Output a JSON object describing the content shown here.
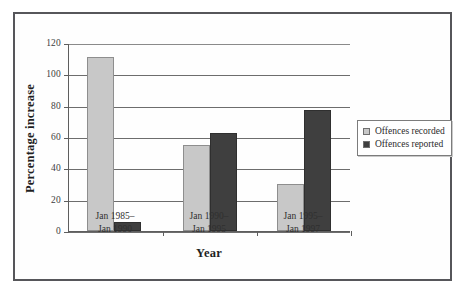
{
  "chart_data": {
    "type": "bar",
    "title": "",
    "xlabel": "Year",
    "ylabel": "Percentage increase",
    "categories": [
      "Jan 1985–\nJan 1990",
      "Jan 1990–\nJan 1995",
      "Jan 1995–\nJan 1997"
    ],
    "category_lines": [
      [
        "Jan 1985–",
        "Jan 1990"
      ],
      [
        "Jan 1990–",
        "Jan 1995"
      ],
      [
        "Jan 1995–",
        "Jan 1997"
      ]
    ],
    "series": [
      {
        "name": "Offences recorded",
        "color": "#c8c8c8",
        "values": [
          111,
          55,
          30
        ]
      },
      {
        "name": "Offences reported",
        "color": "#3f3f3f",
        "values": [
          5.5,
          62.5,
          77
        ]
      }
    ],
    "ylim": [
      0,
      120
    ],
    "yticks": [
      0,
      20,
      40,
      60,
      80,
      100,
      120
    ],
    "ytick_labels": [
      "0",
      "20",
      "40",
      "60",
      "80",
      "100",
      "120"
    ],
    "grid": true,
    "legend_position": "right"
  },
  "axes": {
    "y_title": "Percentage increase",
    "x_title": "Year"
  },
  "legend": {
    "items": [
      {
        "label": "Offences recorded",
        "swatch": "#c8c8c8"
      },
      {
        "label": "Offences reported",
        "swatch": "#3f3f3f"
      }
    ]
  },
  "caption": {
    "text": ""
  }
}
